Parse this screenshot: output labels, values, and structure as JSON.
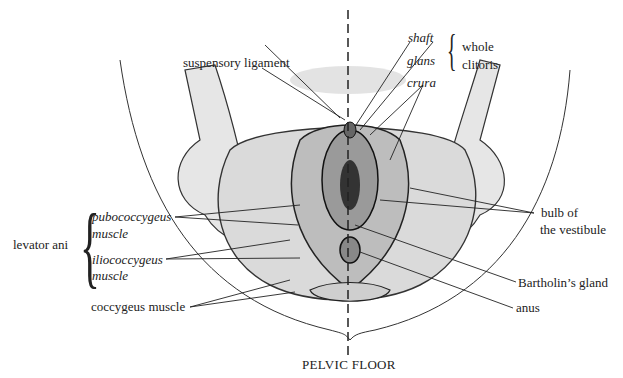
{
  "diagram": {
    "title": "PELVIC FLOOR",
    "labels": {
      "suspensory_ligament": "suspensory ligament",
      "shaft": "shaft",
      "glans": "glans",
      "crura": "crura",
      "whole_clitoris_1": "whole",
      "whole_clitoris_2": "clitoris",
      "levator_ani": "levator ani",
      "pubococcygeus_1": "pubococcygeus",
      "pubococcygeus_2": "muscle",
      "iliococcygeus_1": "iliococcygeus",
      "iliococcygeus_2": "muscle",
      "coccygeus": "coccygeus muscle",
      "bulb_1": "bulb of",
      "bulb_2": "the vestibule",
      "bartholin": "Bartholin’s gland",
      "anus": "anus"
    },
    "colors": {
      "ink": "#222222",
      "background": "#ffffff"
    }
  }
}
